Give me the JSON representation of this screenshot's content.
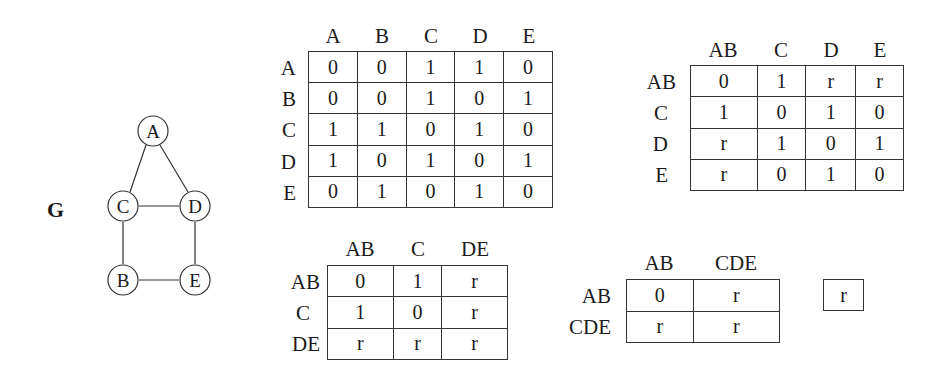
{
  "graph": {
    "label": "G",
    "nodes": [
      {
        "id": "A",
        "x": 153,
        "y": 131
      },
      {
        "id": "C",
        "x": 123,
        "y": 206
      },
      {
        "id": "D",
        "x": 195,
        "y": 206
      },
      {
        "id": "B",
        "x": 123,
        "y": 280
      },
      {
        "id": "E",
        "x": 195,
        "y": 280
      }
    ],
    "edges": [
      [
        "A",
        "C"
      ],
      [
        "A",
        "D"
      ],
      [
        "C",
        "D"
      ],
      [
        "C",
        "B"
      ],
      [
        "D",
        "E"
      ],
      [
        "B",
        "E"
      ]
    ]
  },
  "matrix1": {
    "cols": [
      "A",
      "B",
      "C",
      "D",
      "E"
    ],
    "rows": [
      {
        "label": "A",
        "cells": [
          "0",
          "0",
          "1",
          "1",
          "0"
        ]
      },
      {
        "label": "B",
        "cells": [
          "0",
          "0",
          "1",
          "0",
          "1"
        ]
      },
      {
        "label": "C",
        "cells": [
          "1",
          "1",
          "0",
          "1",
          "0"
        ]
      },
      {
        "label": "D",
        "cells": [
          "1",
          "0",
          "1",
          "0",
          "1"
        ]
      },
      {
        "label": "E",
        "cells": [
          "0",
          "1",
          "0",
          "1",
          "0"
        ]
      }
    ]
  },
  "matrix2": {
    "cols": [
      "AB",
      "C",
      "D",
      "E"
    ],
    "rows": [
      {
        "label": "AB",
        "cells": [
          "0",
          "1",
          "r",
          "r"
        ]
      },
      {
        "label": "C",
        "cells": [
          "1",
          "0",
          "1",
          "0"
        ]
      },
      {
        "label": "D",
        "cells": [
          "r",
          "1",
          "0",
          "1"
        ]
      },
      {
        "label": "E",
        "cells": [
          "r",
          "0",
          "1",
          "0"
        ]
      }
    ]
  },
  "matrix3": {
    "cols": [
      "AB",
      "C",
      "DE"
    ],
    "rows": [
      {
        "label": "AB",
        "cells": [
          "0",
          "1",
          "r"
        ]
      },
      {
        "label": "C",
        "cells": [
          "1",
          "0",
          "r"
        ]
      },
      {
        "label": "DE",
        "cells": [
          "r",
          "r",
          "r"
        ]
      }
    ]
  },
  "matrix4": {
    "cols": [
      "AB",
      "CDE"
    ],
    "rows": [
      {
        "label": "AB",
        "cells": [
          "0",
          "r"
        ]
      },
      {
        "label": "CDE",
        "cells": [
          "r",
          "r"
        ]
      }
    ]
  },
  "matrix5": {
    "cells": [
      "r"
    ]
  }
}
